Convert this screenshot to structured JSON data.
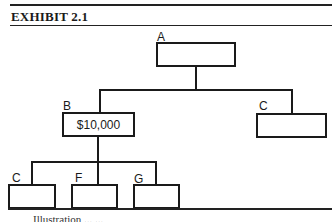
{
  "exhibit": {
    "title": "EXHIBIT 2.1"
  },
  "org_chart": {
    "nodes": [
      {
        "id": "A",
        "label": "A",
        "value": ""
      },
      {
        "id": "B",
        "label": "B",
        "value": "$10,000"
      },
      {
        "id": "C1",
        "label": "C",
        "value": ""
      },
      {
        "id": "C2",
        "label": "C",
        "value": ""
      },
      {
        "id": "F",
        "label": "F",
        "value": ""
      },
      {
        "id": "G",
        "label": "G",
        "value": ""
      }
    ],
    "edges": [
      [
        "A",
        "B"
      ],
      [
        "A",
        "C1"
      ],
      [
        "B",
        "C2"
      ],
      [
        "B",
        "F"
      ],
      [
        "B",
        "G"
      ]
    ]
  },
  "caption": "Illustration ... ..."
}
